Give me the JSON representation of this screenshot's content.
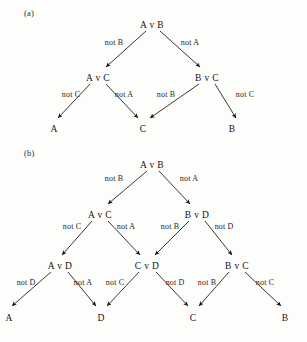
{
  "figure": {
    "background_color": "#fdfdfb",
    "ink_color": "#141414",
    "panels": [
      {
        "id": "panel-a",
        "label": "(a)",
        "label_pos": {
          "x": 24,
          "y": 8
        },
        "nodes": [
          {
            "id": "a-root",
            "text": "A v B",
            "x": 152,
            "y": 20
          },
          {
            "id": "a-l2-left",
            "text": "A v C",
            "x": 98,
            "y": 73
          },
          {
            "id": "a-l2-right",
            "text": "B v C",
            "x": 207,
            "y": 73
          },
          {
            "id": "a-leaf-1",
            "text": "A",
            "x": 54,
            "y": 124,
            "leaf": true
          },
          {
            "id": "a-leaf-2",
            "text": "C",
            "x": 143,
            "y": 124,
            "leaf": true
          },
          {
            "id": "a-leaf-3",
            "text": "B",
            "x": 232,
            "y": 124,
            "leaf": true
          }
        ],
        "edges": [
          {
            "from": "a-root",
            "to": "a-l2-left",
            "label": "not B",
            "label_x": 114,
            "label_y": 38,
            "x1": 146,
            "y1": 31,
            "x2": 106,
            "y2": 67
          },
          {
            "from": "a-root",
            "to": "a-l2-right",
            "label": "not A",
            "label_x": 190,
            "label_y": 38,
            "x1": 160,
            "y1": 31,
            "x2": 200,
            "y2": 67
          },
          {
            "from": "a-l2-left",
            "to": "a-leaf-1",
            "label": "not C",
            "label_x": 71,
            "label_y": 90,
            "x1": 90,
            "y1": 84,
            "x2": 58,
            "y2": 118
          },
          {
            "from": "a-l2-left",
            "to": "a-leaf-2",
            "label": "not A",
            "label_x": 124,
            "label_y": 90,
            "x1": 106,
            "y1": 84,
            "x2": 138,
            "y2": 118
          },
          {
            "from": "a-l2-right",
            "to": "a-leaf-2",
            "label": "not B",
            "label_x": 166,
            "label_y": 90,
            "x1": 199,
            "y1": 84,
            "x2": 150,
            "y2": 118
          },
          {
            "from": "a-l2-right",
            "to": "a-leaf-3",
            "label": "not C",
            "label_x": 245,
            "label_y": 90,
            "x1": 215,
            "y1": 84,
            "x2": 236,
            "y2": 118
          }
        ]
      },
      {
        "id": "panel-b",
        "label": "(b)",
        "label_pos": {
          "x": 24,
          "y": 148
        },
        "nodes": [
          {
            "id": "b-root",
            "text": "A v B",
            "x": 152,
            "y": 160
          },
          {
            "id": "b-l2-left",
            "text": "A v C",
            "x": 100,
            "y": 210
          },
          {
            "id": "b-l2-right",
            "text": "B v D",
            "x": 197,
            "y": 210
          },
          {
            "id": "b-l3-left",
            "text": "A v D",
            "x": 60,
            "y": 261
          },
          {
            "id": "b-l3-center",
            "text": "C v D",
            "x": 147,
            "y": 261
          },
          {
            "id": "b-l3-right",
            "text": "B v C",
            "x": 237,
            "y": 261
          },
          {
            "id": "b-leaf-1",
            "text": "A",
            "x": 9,
            "y": 313,
            "leaf": true
          },
          {
            "id": "b-leaf-2",
            "text": "D",
            "x": 101,
            "y": 313,
            "leaf": true
          },
          {
            "id": "b-leaf-3",
            "text": "C",
            "x": 193,
            "y": 313,
            "leaf": true
          },
          {
            "id": "b-leaf-4",
            "text": "B",
            "x": 285,
            "y": 313,
            "leaf": true
          }
        ],
        "edges": [
          {
            "from": "b-root",
            "to": "b-l2-left",
            "label": "not B",
            "label_x": 114,
            "label_y": 174,
            "x1": 147,
            "y1": 171,
            "x2": 108,
            "y2": 204
          },
          {
            "from": "b-root",
            "to": "b-l2-right",
            "label": "not A",
            "label_x": 189,
            "label_y": 174,
            "x1": 159,
            "y1": 171,
            "x2": 190,
            "y2": 204
          },
          {
            "from": "b-l2-left",
            "to": "b-l3-left",
            "label": "not C",
            "label_x": 72,
            "label_y": 222,
            "x1": 92,
            "y1": 221,
            "x2": 62,
            "y2": 255
          },
          {
            "from": "b-l2-left",
            "to": "b-l3-center",
            "label": "not A",
            "label_x": 126,
            "label_y": 222,
            "x1": 108,
            "y1": 221,
            "x2": 140,
            "y2": 255
          },
          {
            "from": "b-l2-right",
            "to": "b-l3-center",
            "label": "not B",
            "label_x": 170,
            "label_y": 222,
            "x1": 189,
            "y1": 221,
            "x2": 155,
            "y2": 255
          },
          {
            "from": "b-l2-right",
            "to": "b-l3-right",
            "label": "not D",
            "label_x": 224,
            "label_y": 222,
            "x1": 205,
            "y1": 221,
            "x2": 232,
            "y2": 255
          },
          {
            "from": "b-l3-left",
            "to": "b-leaf-1",
            "label": "not D",
            "label_x": 26,
            "label_y": 278,
            "x1": 51,
            "y1": 272,
            "x2": 12,
            "y2": 306
          },
          {
            "from": "b-l3-left",
            "to": "b-leaf-2",
            "label": "not A",
            "label_x": 83,
            "label_y": 278,
            "x1": 68,
            "y1": 272,
            "x2": 96,
            "y2": 306
          },
          {
            "from": "b-l3-center",
            "to": "b-leaf-2",
            "label": "not C",
            "label_x": 115,
            "label_y": 278,
            "x1": 139,
            "y1": 272,
            "x2": 107,
            "y2": 306
          },
          {
            "from": "b-l3-center",
            "to": "b-leaf-3",
            "label": "not D",
            "label_x": 175,
            "label_y": 278,
            "x1": 156,
            "y1": 272,
            "x2": 188,
            "y2": 306
          },
          {
            "from": "b-l3-right",
            "to": "b-leaf-3",
            "label": "not B",
            "label_x": 207,
            "label_y": 278,
            "x1": 229,
            "y1": 272,
            "x2": 199,
            "y2": 306
          },
          {
            "from": "b-l3-right",
            "to": "b-leaf-4",
            "label": "not C",
            "label_x": 265,
            "label_y": 278,
            "x1": 245,
            "y1": 272,
            "x2": 281,
            "y2": 306
          }
        ]
      }
    ]
  }
}
